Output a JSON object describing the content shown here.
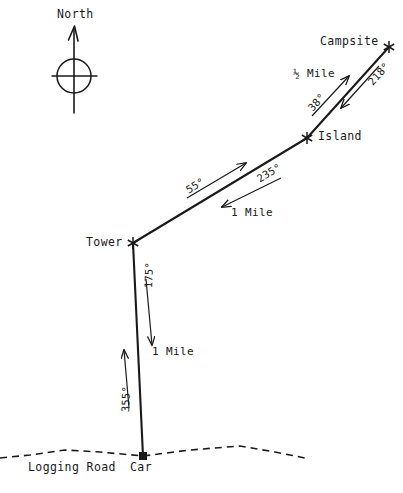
{
  "figure": {
    "kind": "hand-drawn orienteering bearing map",
    "background_color": "#ffffff",
    "ink_color": "#1a1a1a",
    "width": 403,
    "height": 493
  },
  "compass": {
    "label": "North",
    "icon": "compass-rose-icon",
    "center": {
      "x": 74,
      "y": 76
    },
    "radius": 17,
    "needle_top": {
      "x": 74,
      "y": 26
    },
    "needle_bottom": {
      "x": 74,
      "y": 113
    },
    "arm_left": {
      "x": 52,
      "y": 76
    },
    "arm_right": {
      "x": 97,
      "y": 76
    }
  },
  "points": [
    {
      "id": "car",
      "label": "Car",
      "marker": "square-marker",
      "x": 143,
      "y": 456,
      "label_x": 131,
      "label_y": 466
    },
    {
      "id": "tower",
      "label": "Tower",
      "marker": "star-marker",
      "x": 133,
      "y": 243,
      "label_x": 86,
      "label_y": 239
    },
    {
      "id": "island",
      "label": "Island",
      "marker": "star-marker",
      "x": 307,
      "y": 138,
      "label_x": 318,
      "label_y": 133
    },
    {
      "id": "campsite",
      "label": "Campsite",
      "marker": "star-marker",
      "x": 389,
      "y": 47,
      "label_x": 320,
      "label_y": 42
    }
  ],
  "road": {
    "label": "Logging Road",
    "label_x": 30,
    "label_y": 466,
    "style": "dashed",
    "path": "M 0,458 L 30,455 L 65,450 L 100,452 L 143,456 L 190,450 L 240,446 L 275,452 L 305,458"
  },
  "legs": [
    {
      "id": "car-to-tower",
      "from": "car",
      "to": "tower",
      "distance": "1 Mile",
      "outbound_bearing": "355°",
      "return_bearing": "175°",
      "line": {
        "x1": 143,
        "y1": 456,
        "x2": 133,
        "y2": 243
      }
    },
    {
      "id": "tower-to-island",
      "from": "tower",
      "to": "island",
      "distance": "1 Mile",
      "outbound_bearing": "55°",
      "return_bearing": "235°",
      "line": {
        "x1": 133,
        "y1": 243,
        "x2": 307,
        "y2": 138
      }
    },
    {
      "id": "island-to-campsite",
      "from": "island",
      "to": "campsite",
      "distance": "½ Mile",
      "outbound_bearing": "38°",
      "return_bearing": "218°",
      "line": {
        "x1": 307,
        "y1": 138,
        "x2": 389,
        "y2": 47
      }
    }
  ],
  "annotations": {
    "bearing_355": {
      "text": "355°",
      "x": 125,
      "y": 421,
      "rotate": -88
    },
    "bearing_175": {
      "text": "175°",
      "x": 148,
      "y": 297,
      "rotate": -88
    },
    "distance_car_tower": {
      "text": "1 Mile",
      "x": 153,
      "y": 352
    },
    "bearing_55": {
      "text": "55°",
      "x": 191,
      "y": 193,
      "rotate": -31
    },
    "bearing_235": {
      "text": "235°",
      "x": 264,
      "y": 181,
      "rotate": -31
    },
    "distance_tower_island": {
      "text": "1 Mile",
      "x": 232,
      "y": 215
    },
    "bearing_38": {
      "text": "38°",
      "x": 314,
      "y": 112,
      "rotate": -48
    },
    "bearing_218": {
      "text": "218°",
      "x": 372,
      "y": 88,
      "rotate": -48
    },
    "distance_island_campsite": {
      "text": "½ Mile",
      "x": 295,
      "y": 74
    }
  },
  "arrows": {
    "car_to_tower_up": {
      "x1": 129,
      "y1": 408,
      "x2": 124,
      "y2": 350,
      "name": "bearing-arrow-355"
    },
    "tower_to_car_down": {
      "x1": 146,
      "y1": 279,
      "x2": 152,
      "y2": 345,
      "name": "bearing-arrow-175"
    },
    "tower_to_island_up": {
      "x1": 187,
      "y1": 198,
      "x2": 246,
      "y2": 163,
      "name": "bearing-arrow-55"
    },
    "island_to_tower_down": {
      "x1": 281,
      "y1": 178,
      "x2": 222,
      "y2": 207,
      "name": "bearing-arrow-235"
    },
    "island_to_campsite_up": {
      "x1": 312,
      "y1": 116,
      "x2": 349,
      "y2": 76,
      "name": "bearing-arrow-38"
    },
    "campsite_to_island_down": {
      "x1": 379,
      "y1": 66,
      "x2": 341,
      "y2": 108,
      "name": "bearing-arrow-218"
    }
  }
}
